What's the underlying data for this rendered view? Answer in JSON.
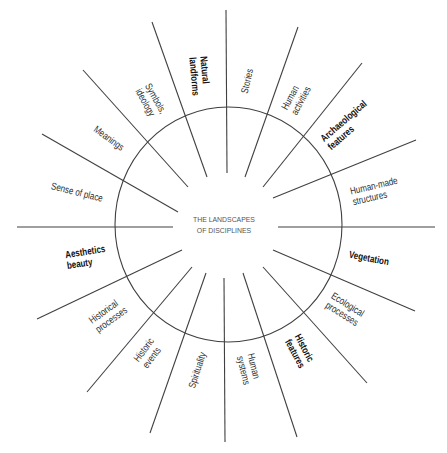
{
  "diagram": {
    "center_title": [
      "THE LANDSCAPES",
      "OF DISCIPLINES"
    ]
  },
  "sectors": [
    {
      "lines": [
        "Stories"
      ],
      "emphasis": "normal"
    },
    {
      "lines": [
        "Human",
        "activities"
      ],
      "emphasis": "normal"
    },
    {
      "lines": [
        "Archaeological",
        "features"
      ],
      "emphasis": "bold"
    },
    {
      "lines": [
        "Human-made",
        "structures"
      ],
      "emphasis": "normal"
    },
    {
      "lines": [
        "Vegetation"
      ],
      "emphasis": "bold"
    },
    {
      "lines": [
        "Ecological",
        "processes"
      ],
      "emphasis": "normal"
    },
    {
      "lines": [
        "Historic",
        "features"
      ],
      "emphasis": "bold"
    },
    {
      "lines": [
        "Human",
        "systems"
      ],
      "emphasis": "normal"
    },
    {
      "lines": [
        "Spirituality"
      ],
      "emphasis": "normal"
    },
    {
      "lines": [
        "Historic",
        "events"
      ],
      "emphasis": "normal"
    },
    {
      "lines": [
        "Historical",
        "processes"
      ],
      "emphasis": "normal"
    },
    {
      "lines": [
        "Aesthetics",
        "beauty"
      ],
      "emphasis": "bold"
    },
    {
      "lines": [
        "Sense of place"
      ],
      "emphasis": "normal"
    },
    {
      "lines": [
        "Meanings"
      ],
      "emphasis": "normal"
    },
    {
      "lines": [
        "Symbols,",
        "ideology"
      ],
      "emphasis": "normal"
    },
    {
      "lines": [
        "Natural",
        "landforms"
      ],
      "emphasis": "bold"
    }
  ],
  "colors": {
    "background": "#ffffff",
    "lines": "#404040",
    "label_text": "#2e2e2e",
    "bold_label_text": "#111111",
    "center_text": "#555555"
  }
}
